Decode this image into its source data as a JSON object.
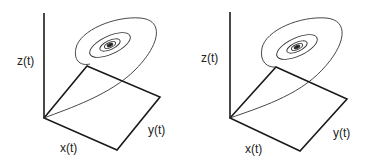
{
  "panels": [
    {
      "id": "left",
      "axis_labels": {
        "z": "z(t)",
        "x": "x(t)",
        "y": "y(t)"
      }
    },
    {
      "id": "right",
      "axis_labels": {
        "z": "z(t)",
        "x": "x(t)",
        "y": "y(t)"
      }
    }
  ],
  "colors": {
    "line": "#1a1a1a",
    "background": "#ffffff"
  }
}
